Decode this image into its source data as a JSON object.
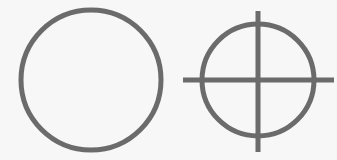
{
  "diagram": {
    "stroke_color": "#6b6b6b",
    "background": "#f7f7f7",
    "shapes": [
      {
        "name": "plain-circle",
        "cx": 91,
        "cy": 80,
        "r": 70
      },
      {
        "name": "crosshair-circle",
        "cx": 258,
        "cy": 80,
        "r": 56
      }
    ]
  }
}
